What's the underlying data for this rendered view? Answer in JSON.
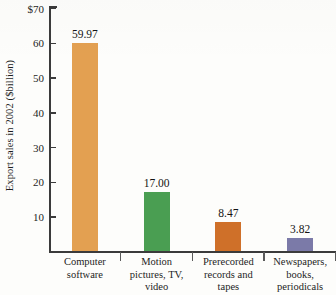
{
  "chart_data": {
    "type": "bar",
    "title": "",
    "xlabel": "",
    "ylabel": "Export sales in 2002 ($billion)",
    "ylim": [
      0,
      70
    ],
    "grid": false,
    "legend": "none",
    "y_ticks": [
      {
        "value": 70,
        "label": "$70"
      },
      {
        "value": 60,
        "label": "60"
      },
      {
        "value": 50,
        "label": "50"
      },
      {
        "value": 40,
        "label": "40"
      },
      {
        "value": 30,
        "label": "30"
      },
      {
        "value": 20,
        "label": "20"
      },
      {
        "value": 10,
        "label": "10"
      }
    ],
    "categories": [
      "Computer software",
      "Motion pictures, TV, video",
      "Prerecorded records and tapes",
      "Newspapers, books, periodicals"
    ],
    "values": [
      59.97,
      17.0,
      8.47,
      3.82
    ],
    "value_labels": [
      "59.97",
      "17.00",
      "8.47",
      "3.82"
    ],
    "bar_colors": [
      "#E3A051",
      "#4A9E52",
      "#CF7029",
      "#7B7AA8"
    ],
    "bars": [
      {
        "category_lines": [
          "Computer",
          "software"
        ],
        "value": 59.97,
        "value_label": "59.97",
        "color": "#E3A051"
      },
      {
        "category_lines": [
          "Motion",
          "pictures, TV,",
          "video"
        ],
        "value": 17.0,
        "value_label": "17.00",
        "color": "#4A9E52"
      },
      {
        "category_lines": [
          "Prerecorded",
          "records and",
          "tapes"
        ],
        "value": 8.47,
        "value_label": "8.47",
        "color": "#CF7029"
      },
      {
        "category_lines": [
          "Newspapers,",
          "books,",
          "periodicals"
        ],
        "value": 3.82,
        "value_label": "3.82",
        "color": "#7B7AA8"
      }
    ]
  }
}
